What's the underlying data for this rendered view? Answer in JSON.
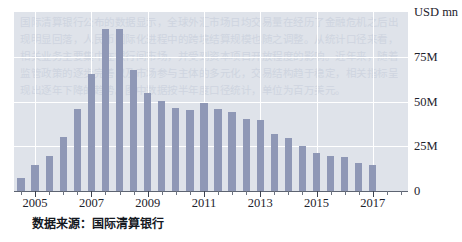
{
  "chart_data": {
    "type": "bar",
    "title": "",
    "subtitle": "",
    "xlabel": "",
    "ylabel": "USD mn",
    "ylim": [
      0,
      100
    ],
    "yticks": [
      0,
      25,
      50,
      75
    ],
    "ytick_labels": [
      "0",
      "25M",
      "50M",
      "75M"
    ],
    "grid": true,
    "legend": null,
    "x_tick_labels": [
      "2005",
      "2007",
      "2009",
      "2011",
      "2013",
      "2015",
      "2017"
    ],
    "x_categories": [
      "2004-H2",
      "2005-H1",
      "2005-H2",
      "2006-H1",
      "2006-H2",
      "2007-H1",
      "2007-H2",
      "2008-H1",
      "2008-H2",
      "2009-H1",
      "2009-H2",
      "2010-H1",
      "2010-H2",
      "2011-H1",
      "2011-H2",
      "2012-H1",
      "2012-H2",
      "2013-H1",
      "2013-H2",
      "2014-H1",
      "2014-H2",
      "2015-H1",
      "2015-H2",
      "2016-H1",
      "2016-H2",
      "2017-H1",
      "2017-H2",
      "2018-H1"
    ],
    "values": [
      7.5,
      14.5,
      19.5,
      30.0,
      46.0,
      65.5,
      90.5,
      90.5,
      67.5,
      55.0,
      50.5,
      46.5,
      45.5,
      49.5,
      46.0,
      44.0,
      40.5,
      39.5,
      32.0,
      29.5,
      25.0,
      21.0,
      19.5,
      19.0,
      15.5,
      14.5,
      0,
      0
    ],
    "bar_color": "#8f98b6",
    "plot_background": "#dfe3ea",
    "gridline_color": "#ffffff",
    "axis_color": "#5d6472",
    "units": "USD mn"
  },
  "axis": {
    "y_title": "USD mn",
    "y_labels": [
      {
        "text": "75M",
        "value": 75
      },
      {
        "text": "50M",
        "value": 50
      },
      {
        "text": "25M",
        "value": 25
      },
      {
        "text": "0",
        "value": 0
      }
    ],
    "x_labels": [
      {
        "text": "2005",
        "index": 1
      },
      {
        "text": "2007",
        "index": 5
      },
      {
        "text": "2009",
        "index": 9
      },
      {
        "text": "2011",
        "index": 13
      },
      {
        "text": "2013",
        "index": 17
      },
      {
        "text": "2015",
        "index": 21
      },
      {
        "text": "2017",
        "index": 25
      }
    ]
  },
  "footer": {
    "source_note": "数据来源：国际清算银行"
  },
  "watermark": {
    "text": "国际清算银行公布的数据显示，全球外汇市场日均交易量在经历了金融危机之后出现明显回落，人民币国际化进程中的跨境结算规模也随之调整。从统计口径来看，相关业务主要集中在银行间市场，并受到资本项目开放程度的影响。近年来，随着监管政策的逐步完善以及市场参与主体的多元化，交易结构趋于稳定，相关指标呈现出逐年下降的趋势。图中数据按半年度口径统计，单位为百万美元。"
  }
}
